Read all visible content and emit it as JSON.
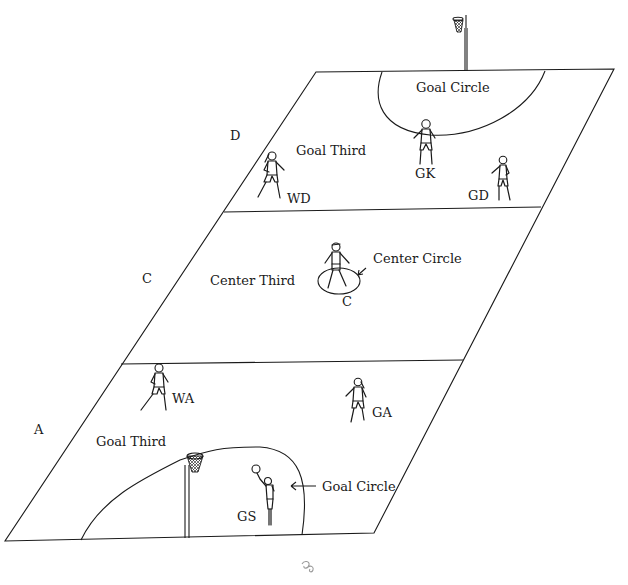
{
  "diagram": {
    "zones": {
      "top_goal_circle": "Goal Circle",
      "top_goal_third": "Goal Third",
      "center_third": "Center Third",
      "center_circle": "Center Circle",
      "bottom_goal_third": "Goal Third",
      "bottom_goal_circle": "Goal Circle"
    },
    "side_letters": {
      "top": "D",
      "middle": "C",
      "bottom": "A"
    },
    "players": {
      "gk": "GK",
      "wd": "WD",
      "gd": "GD",
      "c": "C",
      "wa": "WA",
      "ga": "GA",
      "gs": "GS"
    },
    "footer_ornament": "ornament-icon"
  }
}
